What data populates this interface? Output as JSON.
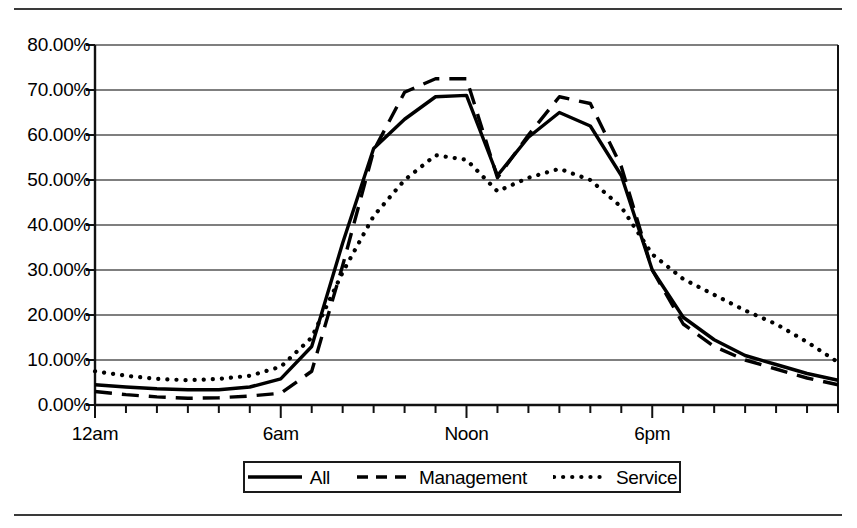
{
  "chart_data": {
    "type": "line",
    "title": "",
    "subtitle": "",
    "xlabel": "",
    "ylabel": "",
    "grid": "horizontal",
    "legend_position": "bottom-center",
    "xlim": [
      0,
      24
    ],
    "ylim": [
      0,
      80
    ],
    "yticks": [
      0,
      10,
      20,
      30,
      40,
      50,
      60,
      70,
      80
    ],
    "ytick_labels": [
      "0.00%",
      "10.00%",
      "20.00%",
      "30.00%",
      "40.00%",
      "50.00%",
      "60.00%",
      "70.00%",
      "80.00%"
    ],
    "xticks": [
      0,
      1,
      2,
      3,
      4,
      5,
      6,
      7,
      8,
      9,
      10,
      11,
      12,
      13,
      14,
      15,
      16,
      17,
      18,
      19,
      20,
      21,
      22,
      23,
      24
    ],
    "xtick_labels": [
      {
        "value": 0,
        "label": "12am"
      },
      {
        "value": 6,
        "label": "6am"
      },
      {
        "value": 12,
        "label": "Noon"
      },
      {
        "value": 18,
        "label": "6pm"
      }
    ],
    "x": [
      0,
      1,
      2,
      3,
      4,
      5,
      6,
      7,
      8,
      9,
      10,
      11,
      12,
      13,
      14,
      15,
      16,
      17,
      18,
      19,
      20,
      21,
      22,
      23,
      24
    ],
    "series": [
      {
        "name": "All",
        "style": "solid",
        "color": "#000000",
        "values": [
          4.5,
          4.0,
          3.6,
          3.4,
          3.4,
          4.0,
          5.8,
          13.0,
          36.0,
          57.0,
          63.5,
          68.5,
          68.8,
          51.0,
          59.5,
          65.0,
          62.0,
          51.0,
          30.0,
          19.5,
          14.5,
          11.0,
          9.0,
          7.0,
          5.5
        ]
      },
      {
        "name": "Management",
        "style": "dashed",
        "color": "#000000",
        "values": [
          3.0,
          2.3,
          1.8,
          1.5,
          1.6,
          2.0,
          2.6,
          7.5,
          31.0,
          56.5,
          69.5,
          72.5,
          72.5,
          50.5,
          60.0,
          68.5,
          67.0,
          53.0,
          30.0,
          18.0,
          13.0,
          10.0,
          8.0,
          6.0,
          4.5
        ]
      },
      {
        "name": "Service",
        "style": "dotted",
        "color": "#000000",
        "values": [
          7.5,
          6.5,
          5.8,
          5.5,
          5.8,
          6.5,
          8.5,
          15.0,
          29.5,
          42.0,
          50.0,
          55.5,
          54.5,
          47.5,
          50.5,
          52.5,
          50.0,
          44.0,
          33.5,
          28.0,
          24.5,
          21.0,
          18.0,
          14.0,
          9.5
        ]
      }
    ]
  },
  "legend": {
    "items": [
      {
        "label": "All",
        "swatch": "solid-line-swatch"
      },
      {
        "label": "Management",
        "swatch": "dashed-line-swatch"
      },
      {
        "label": "Service",
        "swatch": "dotted-line-swatch"
      }
    ]
  }
}
